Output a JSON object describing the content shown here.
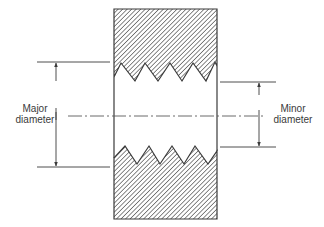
{
  "diagram": {
    "labels": {
      "major": {
        "line1": "Major",
        "line2": "diameter"
      },
      "minor": {
        "line1": "Minor",
        "line2": "diameter"
      }
    },
    "colors": {
      "ink": "#3a3a3a",
      "hatch": "#4a4a4a",
      "background": "#ffffff"
    },
    "body": {
      "x": 114,
      "y": 9,
      "width": 103,
      "height": 210
    },
    "top_thread_profile": [
      [
        114,
        77
      ],
      [
        121,
        63
      ],
      [
        135,
        81
      ],
      [
        145,
        63
      ],
      [
        158,
        81
      ],
      [
        170,
        63
      ],
      [
        182,
        81
      ],
      [
        193,
        63
      ],
      [
        206,
        81
      ],
      [
        215,
        62
      ],
      [
        217,
        66
      ]
    ],
    "bottom_thread_profile": [
      [
        114,
        158
      ],
      [
        125,
        146
      ],
      [
        137,
        164
      ],
      [
        149,
        146
      ],
      [
        160,
        164
      ],
      [
        172,
        146
      ],
      [
        184,
        164
      ],
      [
        195,
        146
      ],
      [
        208,
        164
      ],
      [
        217,
        151
      ]
    ],
    "major_dimension": {
      "x": 56,
      "y_top": 62,
      "y_bottom": 167,
      "ext_x1": 37,
      "ext_x2": 110
    },
    "minor_dimension": {
      "x": 259,
      "y_top": 82,
      "y_bottom": 147,
      "ext_x1": 220,
      "ext_x2": 276
    },
    "centerline": {
      "y": 116,
      "x1": 68,
      "x2": 264
    }
  }
}
